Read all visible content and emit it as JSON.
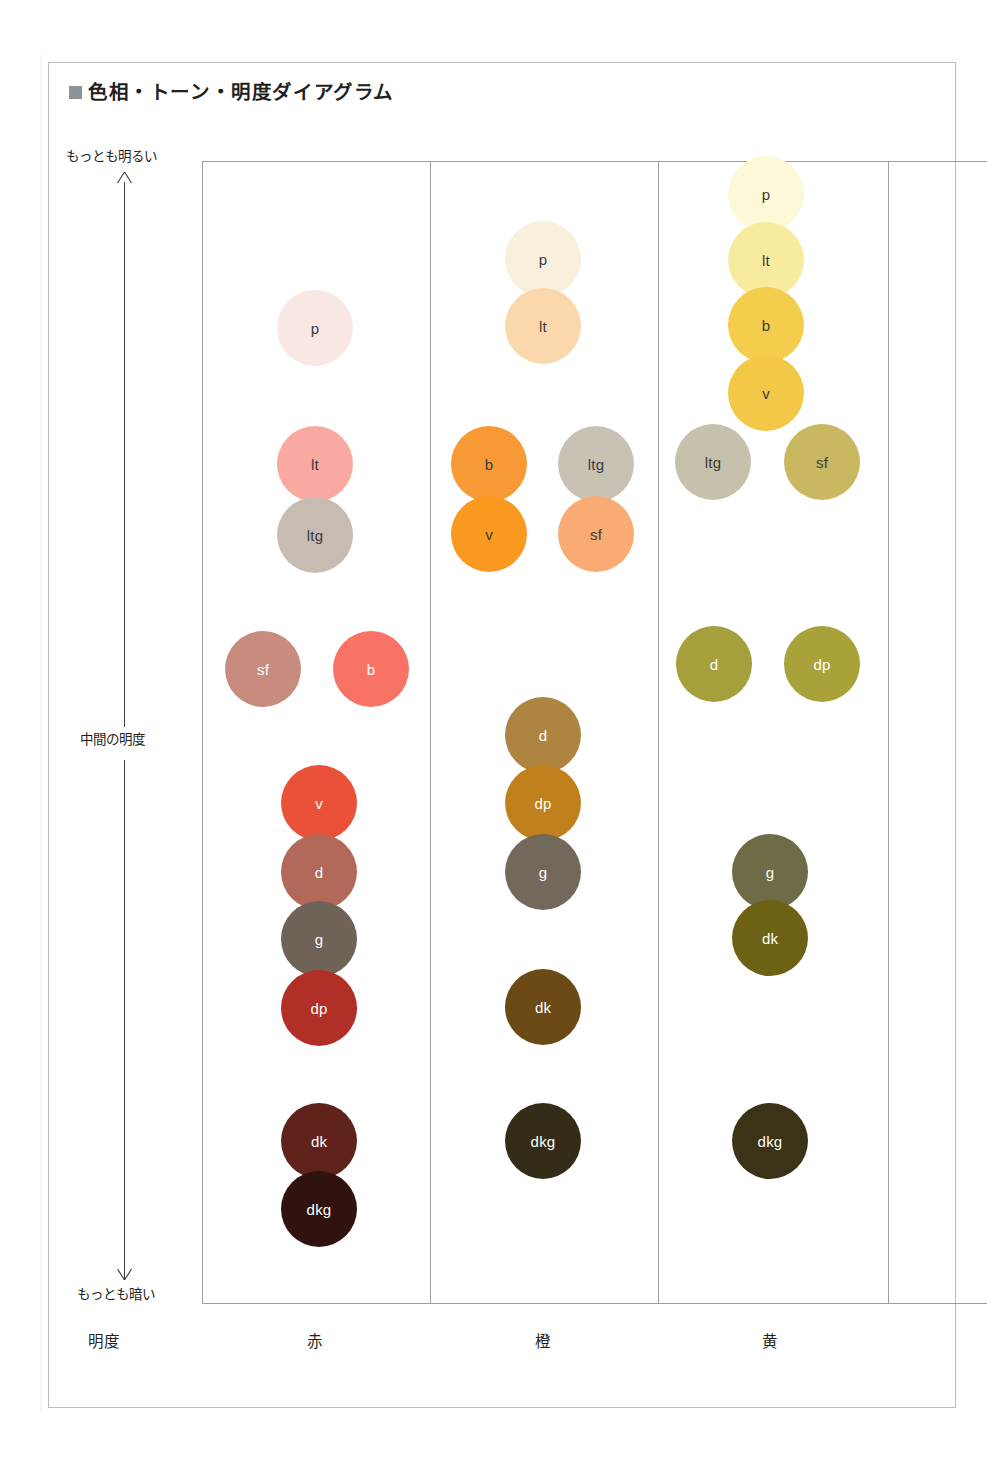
{
  "title": {
    "bullet": "filled-square",
    "text": "色相・トーン・明度ダイアグラム"
  },
  "axis": {
    "vertical_label": "明度",
    "top_label": "もっとも明るい",
    "middle_label": "中間の明度",
    "bottom_label": "もっとも暗い",
    "arrow_up": "arrow-up-icon",
    "arrow_down": "arrow-down-icon"
  },
  "chart_data": {
    "type": "scatter",
    "title": "色相・トーン・明度ダイアグラム",
    "xlabel": "明度",
    "ylabel": "明度",
    "ylim_labels": [
      "もっとも明るい",
      "中間の明度",
      "もっとも暗い"
    ],
    "grid": false,
    "legend": "none",
    "categories": [
      "赤",
      "橙",
      "黄"
    ],
    "series": [
      {
        "name": "赤",
        "column_label": "赤",
        "points": [
          {
            "tone": "p",
            "color": "#f8e7e3",
            "text_color": "#3b3b3b",
            "x": 315,
            "y": 328,
            "r": 38
          },
          {
            "tone": "lt",
            "color": "#f9a8a2",
            "text_color": "#3b3b3b",
            "x": 315,
            "y": 464,
            "r": 38
          },
          {
            "tone": "ltg",
            "color": "#c6bcb1",
            "text_color": "#3b3b3b",
            "x": 315,
            "y": 535,
            "r": 38
          },
          {
            "tone": "sf",
            "color": "#c78c7d",
            "text_color": "#ffffff",
            "x": 263,
            "y": 669,
            "r": 38
          },
          {
            "tone": "b",
            "color": "#f87266",
            "text_color": "#ffffff",
            "x": 371,
            "y": 669,
            "r": 38
          },
          {
            "tone": "v",
            "color": "#ea5138",
            "text_color": "#ffffff",
            "x": 319,
            "y": 803,
            "r": 38
          },
          {
            "tone": "d",
            "color": "#b2695a",
            "text_color": "#ffffff",
            "x": 319,
            "y": 872,
            "r": 38
          },
          {
            "tone": "g",
            "color": "#6f6257",
            "text_color": "#ffffff",
            "x": 319,
            "y": 939,
            "r": 38
          },
          {
            "tone": "dp",
            "color": "#b12f27",
            "text_color": "#ffffff",
            "x": 319,
            "y": 1008,
            "r": 38
          },
          {
            "tone": "dk",
            "color": "#60231b",
            "text_color": "#ffffff",
            "x": 319,
            "y": 1141,
            "r": 38
          },
          {
            "tone": "dkg",
            "color": "#30130e",
            "text_color": "#ffffff",
            "x": 319,
            "y": 1209,
            "r": 38
          }
        ]
      },
      {
        "name": "橙",
        "column_label": "橙",
        "points": [
          {
            "tone": "p",
            "color": "#f8f0dd",
            "text_color": "#3b3b3b",
            "x": 543,
            "y": 259,
            "r": 38
          },
          {
            "tone": "lt",
            "color": "#fbd8ab",
            "text_color": "#3b3b3b",
            "x": 543,
            "y": 326,
            "r": 38
          },
          {
            "tone": "b",
            "color": "#f79a36",
            "text_color": "#3b3b3b",
            "x": 489,
            "y": 464,
            "r": 38
          },
          {
            "tone": "ltg",
            "color": "#c8c2b4",
            "text_color": "#3b3b3b",
            "x": 596,
            "y": 464,
            "r": 38
          },
          {
            "tone": "v",
            "color": "#f9991f",
            "text_color": "#3b3b3b",
            "x": 489,
            "y": 534,
            "r": 38
          },
          {
            "tone": "sf",
            "color": "#f9ab73",
            "text_color": "#3b3b3b",
            "x": 596,
            "y": 534,
            "r": 38
          },
          {
            "tone": "d",
            "color": "#ad8440",
            "text_color": "#ffffff",
            "x": 543,
            "y": 735,
            "r": 38
          },
          {
            "tone": "dp",
            "color": "#c0801c",
            "text_color": "#ffffff",
            "x": 543,
            "y": 803,
            "r": 38
          },
          {
            "tone": "g",
            "color": "#73695a",
            "text_color": "#ffffff",
            "x": 543,
            "y": 872,
            "r": 38
          },
          {
            "tone": "dk",
            "color": "#6c4a16",
            "text_color": "#ffffff",
            "x": 543,
            "y": 1007,
            "r": 38
          },
          {
            "tone": "dkg",
            "color": "#332c17",
            "text_color": "#ffffff",
            "x": 543,
            "y": 1141,
            "r": 38
          }
        ]
      },
      {
        "name": "黄",
        "column_label": "黄",
        "points": [
          {
            "tone": "p",
            "color": "#fbf9d7",
            "text_color": "#3b3b3b",
            "x": 766,
            "y": 194,
            "r": 38
          },
          {
            "tone": "lt",
            "color": "#f9eb9d",
            "text_color": "#3b3b3b",
            "x": 766,
            "y": 260,
            "r": 38
          },
          {
            "tone": "b",
            "color": "#f5cd4d",
            "text_color": "#3b3b3b",
            "x": 766,
            "y": 325,
            "r": 38
          },
          {
            "tone": "v",
            "color": "#f3c846",
            "text_color": "#3b3b3b",
            "x": 766,
            "y": 393,
            "r": 38
          },
          {
            "tone": "ltg",
            "color": "#c5c1ac",
            "text_color": "#3b3b3b",
            "x": 713,
            "y": 462,
            "r": 38
          },
          {
            "tone": "sf",
            "color": "#c9b762",
            "text_color": "#3b3b3b",
            "x": 822,
            "y": 462,
            "r": 38
          },
          {
            "tone": "d",
            "color": "#a5a03b",
            "text_color": "#ffffff",
            "x": 714,
            "y": 664,
            "r": 38
          },
          {
            "tone": "dp",
            "color": "#a9a23a",
            "text_color": "#ffffff",
            "x": 822,
            "y": 664,
            "r": 38
          },
          {
            "tone": "g",
            "color": "#6d6c46",
            "text_color": "#ffffff",
            "x": 770,
            "y": 872,
            "r": 38
          },
          {
            "tone": "dk",
            "color": "#6d6214",
            "text_color": "#ffffff",
            "x": 770,
            "y": 938,
            "r": 38
          },
          {
            "tone": "dkg",
            "color": "#3b3317",
            "text_color": "#ffffff",
            "x": 770,
            "y": 1141,
            "r": 38
          }
        ]
      }
    ],
    "tone_legend_order": [
      "p",
      "lt",
      "b",
      "v",
      "ltg",
      "sf",
      "d",
      "dp",
      "g",
      "dk",
      "dkg"
    ]
  },
  "hue_columns": [
    {
      "label": "赤",
      "center_x": 315
    },
    {
      "label": "橙",
      "center_x": 543
    },
    {
      "label": "黄",
      "center_x": 770
    }
  ],
  "colors": {
    "page_border": "#b9bcbf",
    "grid_line": "#9c9fa3",
    "text": "#231f20",
    "title_bullet": "#8e9398"
  }
}
